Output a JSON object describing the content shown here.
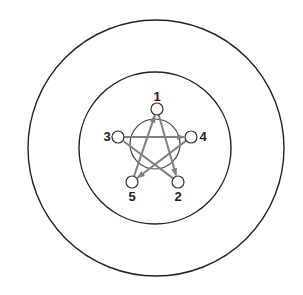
{
  "diagram": {
    "type": "network-in-concentric-circles",
    "colors": {
      "circle_stroke": "#222222",
      "edge_stroke": "#808080",
      "node_stroke": "#333333",
      "node_fill": "#ffffff",
      "label": "#222222"
    },
    "outer_circle": {
      "cx": 156,
      "cy": 148,
      "r": 128
    },
    "inner_circle": {
      "cx": 155,
      "cy": 148,
      "r": 76
    },
    "core_circle": {
      "cx": 155,
      "cy": 144,
      "r": 25
    },
    "nodes": [
      {
        "id": "1",
        "label": "1",
        "cx": 157,
        "cy": 109,
        "lx": 157,
        "ly": 101
      },
      {
        "id": "2",
        "label": "2",
        "cx": 178,
        "cy": 182,
        "lx": 178,
        "ly": 201
      },
      {
        "id": "3",
        "label": "3",
        "cx": 118,
        "cy": 137,
        "lx": 107,
        "ly": 141
      },
      {
        "id": "4",
        "label": "4",
        "cx": 191,
        "cy": 137,
        "lx": 203,
        "ly": 141
      },
      {
        "id": "5",
        "label": "5",
        "cx": 132,
        "cy": 182,
        "lx": 132,
        "ly": 201
      }
    ],
    "edges": [
      {
        "from": "3",
        "to": "4",
        "arrow": true
      },
      {
        "from": "4",
        "to": "5",
        "arrow": true
      },
      {
        "from": "5",
        "to": "1",
        "arrow": true
      },
      {
        "from": "1",
        "to": "2",
        "arrow": true
      },
      {
        "from": "2",
        "to": "3",
        "arrow": false
      }
    ]
  }
}
